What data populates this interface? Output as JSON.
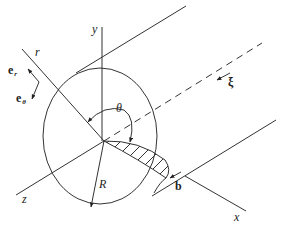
{
  "figure": {
    "labels": {
      "y_axis": "y",
      "z_axis": "z",
      "x_axis": "x",
      "r_axis": "r",
      "theta": "θ",
      "radius": "R",
      "line_direction": "ξ",
      "burgers_vector": "b",
      "unit_vector_r": "e",
      "unit_vector_r_sub": "r",
      "unit_vector_theta": "e",
      "unit_vector_theta_sub": "θ"
    },
    "colors": {
      "ink": "#333333",
      "background": "#ffffff"
    }
  }
}
